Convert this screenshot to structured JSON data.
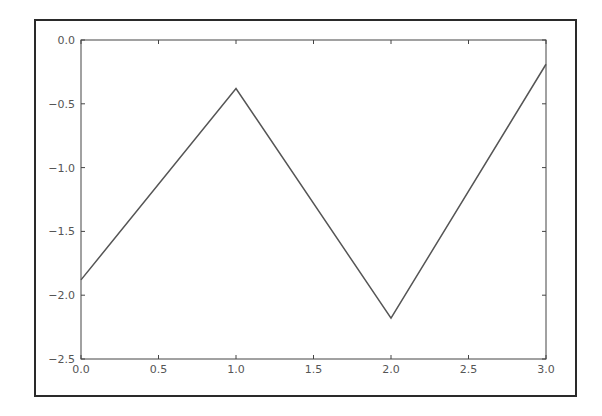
{
  "chart_data": {
    "type": "line",
    "title": "",
    "xlabel": "",
    "ylabel": "",
    "x": [
      0.0,
      1.0,
      2.0,
      3.0
    ],
    "series": [
      {
        "name": "",
        "values": [
          -1.88,
          -0.38,
          -2.18,
          -0.19
        ],
        "color": "#555555"
      }
    ],
    "xlim": [
      0.0,
      3.0
    ],
    "ylim": [
      -2.5,
      0.0
    ],
    "xticks": [
      "0.0",
      "0.5",
      "1.0",
      "1.5",
      "2.0",
      "2.5",
      "3.0"
    ],
    "yticks": [
      "0.0",
      "-0.5",
      "-1.0",
      "-1.5",
      "-2.0",
      "-2.5"
    ],
    "grid": false,
    "legend": null
  }
}
